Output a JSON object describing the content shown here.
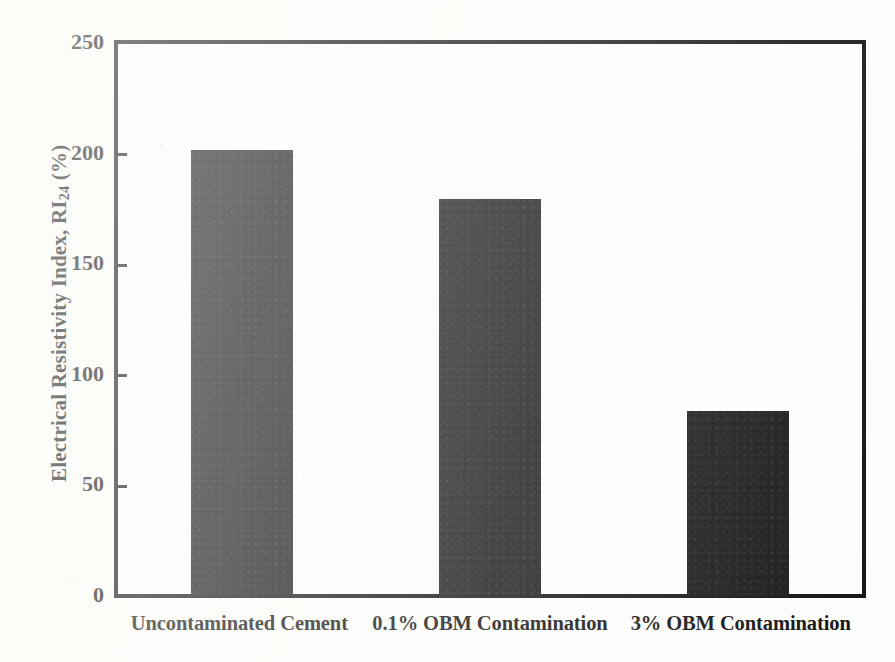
{
  "chart_data": {
    "type": "bar",
    "title": "",
    "subtitle": "",
    "xlabel": "",
    "ylabel": "Electrical Resistivity Index, RI24 (%)",
    "ylabel_parts": {
      "prefix": "Electrical Resistivity Index, RI",
      "subscript": "24",
      "suffix": " (%)"
    },
    "categories": [
      "Uncontaminated Cement",
      "0.1% OBM Contamination",
      "3% OBM Contamination"
    ],
    "values": [
      201,
      179,
      83
    ],
    "ylim": [
      0,
      250
    ],
    "yticks": [
      0,
      50,
      100,
      150,
      200,
      250
    ],
    "ytick_labels": [
      "0",
      "50",
      "100",
      "150",
      "200",
      "250"
    ],
    "grid": false,
    "legend": null,
    "legend_position": "none",
    "series": [
      {
        "name": "Electrical Resistivity Index",
        "values": [
          201,
          179,
          83
        ]
      }
    ],
    "bar_color": "#151515",
    "axis_color": "#121212",
    "background_color": "#fefefe"
  }
}
